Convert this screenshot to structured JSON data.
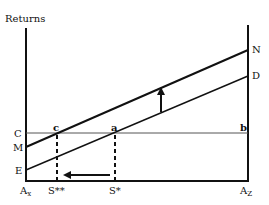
{
  "diagram": {
    "y_axis_label": "Returns",
    "left_axis_labels": {
      "c_level": "C",
      "m_level": "M",
      "e_level": "E"
    },
    "right_axis_labels": {
      "n_level": "N",
      "d_level": "D"
    },
    "point_labels": {
      "c": "c",
      "a": "a",
      "b": "b"
    },
    "x_axis_labels": {
      "left_base": "A",
      "left_sub": "x",
      "s_double_star": "S**",
      "s_star": "S*",
      "right_base": "A",
      "right_sub": "Z"
    },
    "lines": {
      "upper_line": "M to N (shifted returns line)",
      "lower_line": "E to D (original returns line)",
      "horizontal_line": "C to b (constant return)"
    },
    "arrows": {
      "shift_up": "upward shift from ED to MN",
      "shift_left": "equilibrium moves from S* to S**"
    },
    "colors": {
      "line": "#111111",
      "horizontal": "#555555",
      "background": "#ffffff"
    }
  }
}
